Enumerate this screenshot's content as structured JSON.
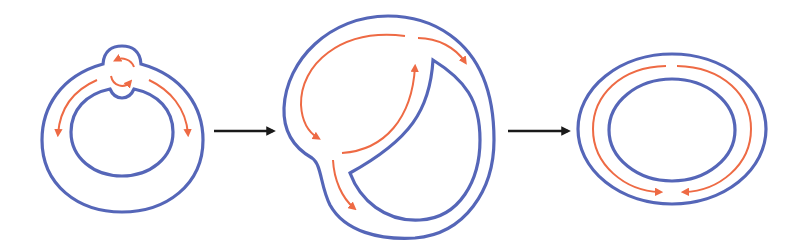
{
  "diagram": {
    "description": "Three-stage schematic: a ring with a local bump and rotating strands deforms into a distorted loop and then relaxes into a concentric elliptical ring with opposing flows meeting at the bottom.",
    "colors": {
      "boundary": "#5566b8",
      "flow": "#ee6a44",
      "transition_arrow": "#1a1a1a",
      "background": "#ffffff"
    },
    "stages": [
      {
        "id": "stage-1",
        "label": "Ring with bump and circulating flow",
        "shape": "annulus-with-top-bump",
        "flow_arrows": [
          "left-downward",
          "right-downward",
          "circular-pair-in-bump"
        ]
      },
      {
        "id": "stage-2",
        "label": "Deformed loop with internal cusp",
        "shape": "distorted-blob-with-inner-cusp",
        "flow_arrows": [
          "upper-left-arc-to-lower-left",
          "inner-arc-upward",
          "top-right-arc",
          "lower-left-downward"
        ]
      },
      {
        "id": "stage-3",
        "label": "Concentric elliptical ring",
        "shape": "elliptical-annulus",
        "flow_arrows": [
          "left-half-clockwise-to-bottom",
          "right-half-counterclockwise-to-bottom"
        ]
      }
    ],
    "transitions": [
      {
        "from": "stage-1",
        "to": "stage-2",
        "symbol": "right-arrow"
      },
      {
        "from": "stage-2",
        "to": "stage-3",
        "symbol": "right-arrow"
      }
    ]
  }
}
